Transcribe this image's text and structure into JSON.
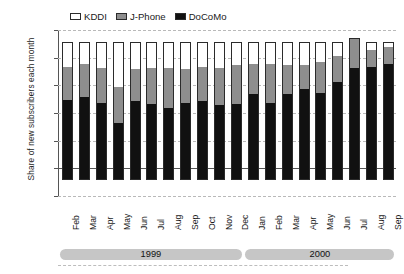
{
  "axes": {
    "ylabel": "Share of new subscribers each month",
    "yticks": [
      "100%",
      "80%",
      "60%",
      "40%",
      "20%",
      "0",
      "-20%"
    ],
    "ytick_values": [
      100,
      80,
      60,
      40,
      20,
      0,
      -20
    ]
  },
  "legend": {
    "items": [
      {
        "label": "KDDI",
        "color": "#ffffff",
        "icon": "legend-swatch-kddi"
      },
      {
        "label": "J-Phone",
        "color": "#8e8e8e",
        "icon": "legend-swatch-jphone"
      },
      {
        "label": "DoCoMo",
        "color": "#111111",
        "icon": "legend-swatch-docomo"
      }
    ]
  },
  "year_bands": [
    {
      "label": "1999",
      "start_index": 0,
      "end_index": 10
    },
    {
      "label": "2000",
      "start_index": 11,
      "end_index": 19
    }
  ],
  "chart_data": {
    "type": "bar",
    "stacked": true,
    "title": "",
    "xlabel": "",
    "ylabel": "Share of new subscribers each month",
    "ylim": [
      -20,
      100
    ],
    "ytick_step": 20,
    "grid": true,
    "legend_position": "top",
    "categories": [
      "Feb",
      "Mar",
      "Apr",
      "May",
      "Jun",
      "Jul",
      "Aug",
      "Sep",
      "Oct",
      "Nov",
      "Dec",
      "Jan",
      "Feb",
      "Mar",
      "Apr",
      "May",
      "Jun",
      "Jul",
      "Aug",
      "Sep"
    ],
    "years": [
      "1999",
      "1999",
      "1999",
      "1999",
      "1999",
      "1999",
      "1999",
      "1999",
      "1999",
      "1999",
      "1999",
      "2000",
      "2000",
      "2000",
      "2000",
      "2000",
      "2000",
      "2000",
      "2000",
      "2000"
    ],
    "series": [
      {
        "name": "DoCoMo",
        "color": "#111111",
        "values": [
          58,
          60,
          56,
          41,
          57,
          55,
          52,
          56,
          57,
          54,
          55,
          62,
          56,
          62,
          66,
          63,
          71,
          81,
          82,
          84
        ]
      },
      {
        "name": "J-Phone",
        "color": "#8e8e8e",
        "values": [
          24,
          24,
          25,
          26,
          23,
          26,
          29,
          24,
          25,
          27,
          28,
          22,
          28,
          21,
          17,
          22,
          19,
          22,
          12,
          12
        ]
      },
      {
        "name": "KDDI",
        "color": "#ffffff",
        "values": [
          18,
          16,
          19,
          33,
          20,
          19,
          19,
          20,
          18,
          19,
          17,
          16,
          16,
          17,
          17,
          15,
          10,
          0,
          6,
          4
        ]
      }
    ],
    "totals": [
      100,
      100,
      100,
      100,
      100,
      100,
      100,
      100,
      100,
      100,
      100,
      100,
      100,
      100,
      100,
      100,
      100,
      103,
      100,
      100
    ]
  }
}
